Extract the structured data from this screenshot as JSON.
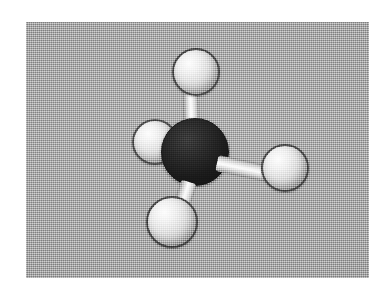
{
  "figure": {
    "caption": "",
    "molecule_name": "Methane",
    "molecule_formula": "CH4",
    "geometry": "tetrahedral",
    "media_type": "scanned halftone photograph",
    "plate": {
      "background_color": "#a5a5a5",
      "page_color": "#ffffff",
      "x": 26,
      "y": 22,
      "width": 343,
      "height": 256
    }
  },
  "model": {
    "atoms": [
      {
        "id": "carbon-center",
        "element": "C",
        "element_name": "Carbon",
        "role": "central-atom",
        "color": "#000000",
        "cx": 169,
        "cy": 130,
        "r": 34
      },
      {
        "id": "hydrogen-top",
        "element": "H",
        "element_name": "Hydrogen",
        "role": "terminal-atom",
        "color": "#e0e0e0",
        "cx": 170,
        "cy": 50,
        "r": 24
      },
      {
        "id": "hydrogen-left",
        "element": "H",
        "element_name": "Hydrogen",
        "role": "terminal-atom",
        "color": "#e0e0e0",
        "cx": 129,
        "cy": 120,
        "r": 23
      },
      {
        "id": "hydrogen-bottom",
        "element": "H",
        "element_name": "Hydrogen",
        "role": "terminal-atom",
        "color": "#e0e0e0",
        "cx": 146,
        "cy": 200,
        "r": 26
      },
      {
        "id": "hydrogen-right",
        "element": "H",
        "element_name": "Hydrogen",
        "role": "terminal-atom",
        "color": "#e0e0e0",
        "cx": 259,
        "cy": 146,
        "r": 24
      }
    ],
    "bonds": [
      {
        "id": "bond-c-h-top",
        "from": "carbon-center",
        "to": "hydrogen-top",
        "order": 1,
        "color": "#f0f0f0"
      },
      {
        "id": "bond-c-h-left",
        "from": "carbon-center",
        "to": "hydrogen-left",
        "order": 1,
        "color": "#f0f0f0"
      },
      {
        "id": "bond-c-h-bottom",
        "from": "carbon-center",
        "to": "hydrogen-bottom",
        "order": 1,
        "color": "#f0f0f0"
      },
      {
        "id": "bond-c-h-right",
        "from": "carbon-center",
        "to": "hydrogen-right",
        "order": 1,
        "color": "#f0f0f0"
      }
    ]
  }
}
